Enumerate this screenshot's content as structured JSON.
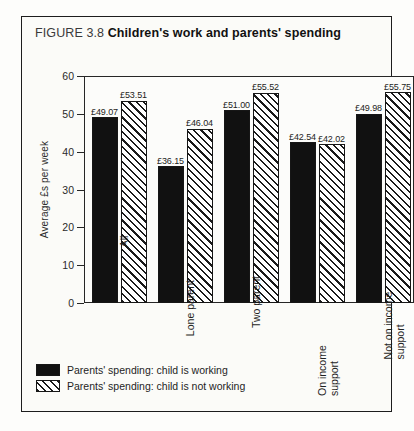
{
  "figure": {
    "number": "FIGURE 3.8",
    "caption": "Children's work and parents' spending"
  },
  "chart_data": {
    "type": "bar",
    "title": "Children's work and parents' spending",
    "xlabel": "",
    "ylabel": "Average £s per week",
    "ylim": [
      0,
      60
    ],
    "yticks": [
      0,
      10,
      20,
      30,
      40,
      50,
      60
    ],
    "ytick_labels": [
      "0",
      "10",
      "20",
      "30",
      "40",
      "50",
      "60"
    ],
    "grid": false,
    "legend_position": "below-plot-left",
    "categories": [
      "All",
      "Lone parent",
      "Two parent",
      "On income support",
      "Not on income\nsupport"
    ],
    "series": [
      {
        "name": "Parents' spending: child is working",
        "style": "solid-black",
        "values": [
          49.07,
          36.15,
          51.0,
          42.54,
          49.98
        ],
        "labels": [
          "£49.07",
          "£36.15",
          "£51.00",
          "£42.54",
          "£49.98"
        ]
      },
      {
        "name": "Parents' spending: child is not working",
        "style": "diagonal-hatch",
        "values": [
          53.51,
          46.04,
          55.52,
          42.02,
          55.75
        ],
        "labels": [
          "£53.51",
          "£46.04",
          "£55.52",
          "£42.02",
          "£55.75"
        ]
      }
    ]
  },
  "legend": {
    "items": [
      {
        "label": "Parents' spending: child is working",
        "style": "solid"
      },
      {
        "label": "Parents' spending: child is not working",
        "style": "hatched"
      }
    ]
  },
  "colors": {
    "series_working": "#111111",
    "series_not_working": "#ffffff",
    "hatch": "#1a1a1a",
    "frame": "#1d1d1d",
    "page_background": "#fdfdfb"
  }
}
